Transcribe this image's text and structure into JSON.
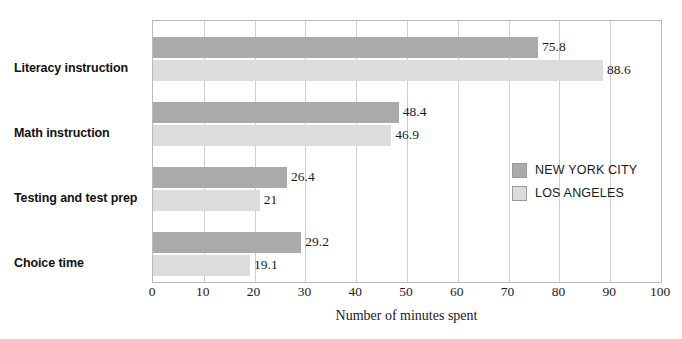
{
  "chart_data": {
    "type": "bar",
    "orientation": "horizontal",
    "title": "",
    "xlabel": "Number of minutes spent",
    "ylabel": "",
    "xlim": [
      0,
      100
    ],
    "xticks": [
      0,
      10,
      20,
      30,
      40,
      50,
      60,
      70,
      80,
      90,
      100
    ],
    "xtick_labels": [
      "0",
      "10",
      "20",
      "30",
      "40",
      "50",
      "60",
      "70",
      "80",
      "90",
      "100"
    ],
    "grid": "vertical",
    "legend_position": "inside-right",
    "categories": [
      "Literacy instruction",
      "Math instruction",
      "Testing and test prep",
      "Choice time"
    ],
    "series": [
      {
        "name": "NEW YORK CITY",
        "color": "#aaaaaa",
        "values": [
          75.8,
          48.4,
          26.4,
          29.2
        ],
        "value_labels": [
          "75.8",
          "48.4",
          "26.4",
          "29.2"
        ]
      },
      {
        "name": "LOS ANGELES",
        "color": "#dcdcdc",
        "values": [
          88.6,
          46.9,
          21,
          19.1
        ],
        "value_labels": [
          "88.6",
          "46.9",
          "21",
          "19.1"
        ]
      }
    ]
  },
  "legend": {
    "items": [
      {
        "label": "NEW YORK CITY",
        "color": "#aaaaaa"
      },
      {
        "label": "LOS ANGELES",
        "color": "#dcdcdc"
      }
    ]
  },
  "axis": {
    "x_title": "Number of minutes spent"
  }
}
